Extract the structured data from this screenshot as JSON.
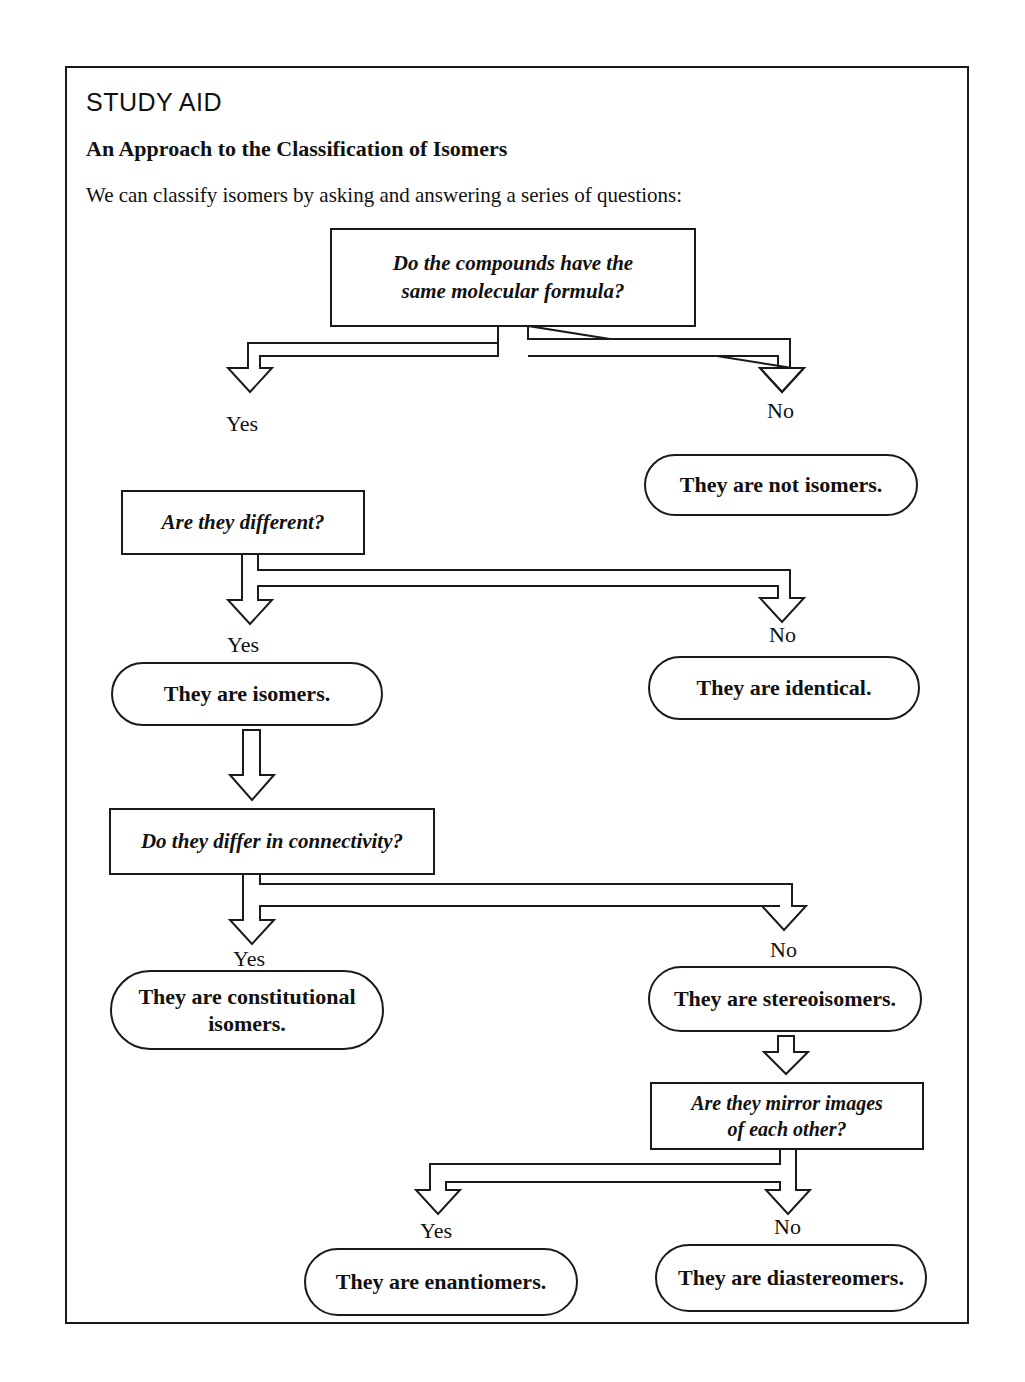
{
  "header": {
    "tag": "STUDY AID",
    "title": "An Approach to the Classification of Isomers",
    "intro": "We can classify isomers by asking and answering a series of questions:"
  },
  "flowchart": {
    "questions": [
      {
        "id": "q1",
        "text_line1": "Do the compounds have the",
        "text_line2": "same molecular formula?"
      },
      {
        "id": "q2",
        "text": "Are they different?"
      },
      {
        "id": "q3",
        "text": "Do they differ in connectivity?"
      },
      {
        "id": "q4",
        "text_line1": "Are they mirror images",
        "text_line2": "of each other?"
      }
    ],
    "answers": {
      "yes": "Yes",
      "no": "No"
    },
    "outcomes": [
      {
        "id": "not-isomers",
        "text": "They are not isomers."
      },
      {
        "id": "isomers",
        "text": "They are isomers."
      },
      {
        "id": "identical",
        "text": "They are identical."
      },
      {
        "id": "constitutional",
        "text_line1": "They are constitutional",
        "text_line2": "isomers."
      },
      {
        "id": "stereoisomers",
        "text": "They are stereoisomers."
      },
      {
        "id": "enantiomers",
        "text": "They are enantiomers."
      },
      {
        "id": "diastereomers",
        "text": "They are diastereomers."
      }
    ]
  }
}
